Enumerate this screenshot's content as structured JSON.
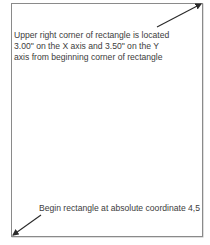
{
  "diagram": {
    "type": "annotated-rectangle",
    "upper_note": {
      "lines": [
        "Upper right corner of rectangle is located",
        "3.00\" on the X axis and 3.50\" on the Y",
        "axis from beginning corner of rectangle"
      ]
    },
    "lower_note": {
      "text": "Begin rectangle at absolute coordinate 4,5"
    },
    "arrows": [
      {
        "name": "upper-right-arrow",
        "points_to": "upper-right-corner"
      },
      {
        "name": "lower-left-arrow",
        "points_to": "lower-left-corner"
      }
    ],
    "colors": {
      "border": "#8a8a8a",
      "text": "#3c3c3c",
      "arrow": "#2a2a2a"
    }
  }
}
